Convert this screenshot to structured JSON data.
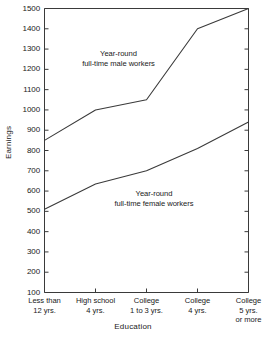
{
  "chart_data": {
    "type": "line",
    "title": "",
    "xlabel": "Education",
    "ylabel": "Earnings",
    "categories": [
      "Less than\n12 yrs.",
      "High school\n4 yrs.",
      "College\n1 to 3 yrs.",
      "College\n4 yrs.",
      "College\n5 yrs.\nor more"
    ],
    "category_lines": [
      [
        "Less than",
        "12 yrs."
      ],
      [
        "High school",
        "4 yrs."
      ],
      [
        "College",
        "1 to 3 yrs."
      ],
      [
        "College",
        "4 yrs."
      ],
      [
        "College",
        "5 yrs.",
        "or more"
      ]
    ],
    "ylim": [
      100,
      1500
    ],
    "ytick_values": [
      100,
      200,
      300,
      400,
      500,
      600,
      700,
      800,
      900,
      1000,
      1100,
      1200,
      1300,
      1400,
      1500
    ],
    "ytick_labels": [
      "100",
      "200",
      "300",
      "400",
      "500",
      "600",
      "700",
      "800",
      "900",
      "1000",
      "1100",
      "1200",
      "1300",
      "1400",
      "1500"
    ],
    "grid": false,
    "legend_position": "inline-annotations",
    "series": [
      {
        "name": "Year-round full-time male workers",
        "label_lines": [
          "Year-round",
          "full-time male workers"
        ],
        "values": [
          850,
          1000,
          1050,
          1400,
          1500
        ],
        "color": "#3a3a3a"
      },
      {
        "name": "Year-round full-time female workers",
        "label_lines": [
          "Year-round",
          "full-time female workers"
        ],
        "values": [
          510,
          635,
          700,
          810,
          940
        ],
        "color": "#3a3a3a"
      }
    ],
    "annotations": [
      {
        "text_lines": [
          "Year-round",
          "full-time male workers"
        ],
        "series": "male"
      },
      {
        "text_lines": [
          "Year-round",
          "full-time female workers"
        ],
        "series": "female"
      }
    ]
  },
  "axis_color": "#3a3a3a",
  "line_color": "#3a3a3a"
}
